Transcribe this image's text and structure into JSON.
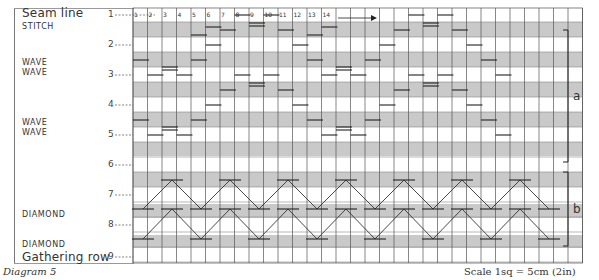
{
  "diagram": {
    "caption": "Diagram 5",
    "scale_label": "Scale 1sq = 5cm (2in)",
    "header_label": "Seam line",
    "gathering_label": "Gathering row",
    "section_labels": [
      {
        "text": "STITCH",
        "y": 22
      },
      {
        "text": "WAVE",
        "y": 58
      },
      {
        "text": "WAVE",
        "y": 68
      },
      {
        "text": "WAVE",
        "y": 118
      },
      {
        "text": "WAVE",
        "y": 128
      },
      {
        "text": "DIAMOND",
        "y": 210
      },
      {
        "text": "DIAMOND",
        "y": 240
      }
    ],
    "row_numbers": [
      {
        "n": "1",
        "y": 15
      },
      {
        "n": "2",
        "y": 45
      },
      {
        "n": "3",
        "y": 75
      },
      {
        "n": "4",
        "y": 105
      },
      {
        "n": "5",
        "y": 135
      },
      {
        "n": "6",
        "y": 165
      },
      {
        "n": "7",
        "y": 195
      },
      {
        "n": "8",
        "y": 225
      },
      {
        "n": "9",
        "y": 257
      }
    ],
    "column_numbers": [
      "1",
      "2",
      "3",
      "4",
      "5",
      "6",
      "7",
      "8",
      "9",
      "10",
      "11",
      "12",
      "13",
      "14"
    ],
    "brackets": [
      {
        "label": "a",
        "top": 30,
        "bottom": 162
      },
      {
        "label": "b",
        "top": 172,
        "bottom": 246
      }
    ],
    "colors": {
      "gray_band": "#c9c9c9",
      "grid_line": "#555555",
      "stitch": "#222222"
    }
  }
}
